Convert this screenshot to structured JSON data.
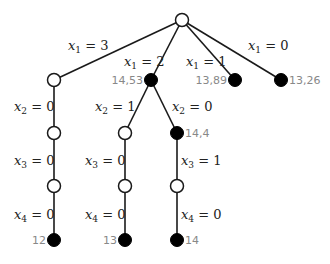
{
  "tree": {
    "nodes": [
      {
        "id": "root",
        "x": 182,
        "y": 20,
        "filled": false,
        "value": null
      },
      {
        "id": "a",
        "x": 54,
        "y": 80,
        "filled": false,
        "value": null
      },
      {
        "id": "b",
        "x": 151,
        "y": 80,
        "filled": true,
        "value": "14,53",
        "value_side": "left"
      },
      {
        "id": "c",
        "x": 235,
        "y": 80,
        "filled": true,
        "value": "13,89",
        "value_side": "left"
      },
      {
        "id": "d",
        "x": 281,
        "y": 80,
        "filled": true,
        "value": "13,26",
        "value_side": "right"
      },
      {
        "id": "a2",
        "x": 54,
        "y": 133,
        "filled": false,
        "value": null
      },
      {
        "id": "b1",
        "x": 125,
        "y": 133,
        "filled": false,
        "value": null
      },
      {
        "id": "b2",
        "x": 177,
        "y": 133,
        "filled": true,
        "value": "14,4",
        "value_side": "right"
      },
      {
        "id": "a3",
        "x": 54,
        "y": 186,
        "filled": false,
        "value": null
      },
      {
        "id": "b13",
        "x": 125,
        "y": 186,
        "filled": false,
        "value": null
      },
      {
        "id": "b23",
        "x": 177,
        "y": 186,
        "filled": false,
        "value": null
      },
      {
        "id": "a4",
        "x": 54,
        "y": 240,
        "filled": true,
        "value": "12",
        "value_side": "left"
      },
      {
        "id": "b14",
        "x": 125,
        "y": 240,
        "filled": true,
        "value": "13",
        "value_side": "left"
      },
      {
        "id": "b24",
        "x": 177,
        "y": 240,
        "filled": true,
        "value": "14",
        "value_side": "right"
      }
    ],
    "edges": [
      {
        "from": "root",
        "to": "a",
        "var": "x",
        "sub": "1",
        "val": "3",
        "lx": 68,
        "ly": 50
      },
      {
        "from": "root",
        "to": "b",
        "var": "x",
        "sub": "1",
        "val": "2",
        "lx": 124,
        "ly": 66
      },
      {
        "from": "root",
        "to": "c",
        "var": "x",
        "sub": "1",
        "val": "1",
        "lx": 186,
        "ly": 66
      },
      {
        "from": "root",
        "to": "d",
        "var": "x",
        "sub": "1",
        "val": "0",
        "lx": 248,
        "ly": 50
      },
      {
        "from": "a",
        "to": "a2",
        "var": "x",
        "sub": "2",
        "val": "0",
        "lx": 14,
        "ly": 111
      },
      {
        "from": "b",
        "to": "b1",
        "var": "x",
        "sub": "2",
        "val": "1",
        "lx": 95,
        "ly": 111
      },
      {
        "from": "b",
        "to": "b2",
        "var": "x",
        "sub": "2",
        "val": "0",
        "lx": 172,
        "ly": 111
      },
      {
        "from": "a2",
        "to": "a3",
        "var": "x",
        "sub": "3",
        "val": "0",
        "lx": 14,
        "ly": 165
      },
      {
        "from": "b1",
        "to": "b13",
        "var": "x",
        "sub": "3",
        "val": "0",
        "lx": 85,
        "ly": 165
      },
      {
        "from": "b2",
        "to": "b23",
        "var": "x",
        "sub": "3",
        "val": "1",
        "lx": 181,
        "ly": 165
      },
      {
        "from": "a3",
        "to": "a4",
        "var": "x",
        "sub": "4",
        "val": "0",
        "lx": 14,
        "ly": 219
      },
      {
        "from": "b13",
        "to": "b14",
        "var": "x",
        "sub": "4",
        "val": "0",
        "lx": 85,
        "ly": 219
      },
      {
        "from": "b23",
        "to": "b24",
        "var": "x",
        "sub": "4",
        "val": "0",
        "lx": 181,
        "ly": 219
      }
    ]
  }
}
